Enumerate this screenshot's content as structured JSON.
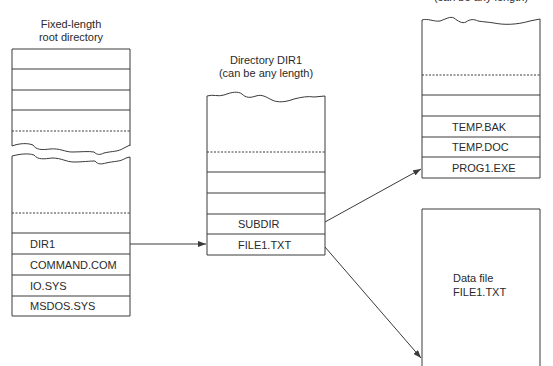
{
  "root_directory": {
    "title_line1": "Fixed-length",
    "title_line2": "root directory",
    "entries": [
      "DIR1",
      "COMMAND.COM",
      "IO.SYS",
      "MSDOS.SYS"
    ]
  },
  "dir1": {
    "title_line1": "Directory DIR1",
    "title_line2": "(can be any length)",
    "entries": [
      "SUBDIR",
      "FILE1.TXT"
    ]
  },
  "subdir": {
    "title_partial": "(can be any length)",
    "entries": [
      "TEMP.BAK",
      "TEMP.DOC",
      "PROG1.EXE"
    ]
  },
  "data_file": {
    "line1": "Data file",
    "line2": "FILE1.TXT"
  },
  "colors": {
    "stroke": "#3a3a3a",
    "text": "#2a2a2a",
    "background": "#ffffff"
  }
}
